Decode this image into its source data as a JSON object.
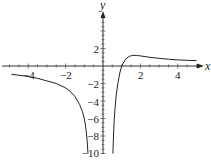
{
  "chart_data": {
    "type": "line",
    "title": "",
    "xlabel": "x",
    "ylabel": "y",
    "xlim": [
      -5.5,
      5.3
    ],
    "ylim": [
      -10,
      5.5
    ],
    "grid": false,
    "legend": null,
    "x_ticks": [
      -4,
      -2,
      2,
      4
    ],
    "y_ticks": [
      2,
      -2,
      -4,
      -6,
      -8,
      -10
    ],
    "x_tick_labels": [
      "−4",
      "−2",
      "2",
      "4"
    ],
    "y_tick_labels": [
      "2",
      "−2",
      "−4",
      "−6",
      "−8",
      "−10"
    ],
    "vertical_asymptote": 0,
    "horizontal_asymptote": 0,
    "series": [
      {
        "name": "left branch",
        "x": [
          -4.9,
          -4.5,
          -4,
          -3.5,
          -3,
          -2.5,
          -2,
          -1.75,
          -1.5,
          -1.25,
          -1.1,
          -1.0,
          -0.95,
          -0.9,
          -0.85,
          -0.8
        ],
        "y": [
          -0.95,
          -1.05,
          -1.2,
          -1.4,
          -1.7,
          -2.0,
          -2.5,
          -2.9,
          -3.5,
          -4.4,
          -5.2,
          -6.0,
          -6.6,
          -7.4,
          -8.5,
          -10.0
        ]
      },
      {
        "name": "right branch",
        "x": [
          0.53,
          0.56,
          0.6,
          0.65,
          0.7,
          0.8,
          0.9,
          1.0,
          1.2,
          1.4,
          1.6,
          1.8,
          2.0,
          2.5,
          3.0,
          3.5,
          4.0,
          4.5,
          5.0
        ],
        "y": [
          -10.0,
          -8.0,
          -6.2,
          -4.6,
          -3.4,
          -1.9,
          -0.8,
          0.0,
          0.75,
          1.1,
          1.22,
          1.2,
          1.15,
          1.0,
          0.88,
          0.78,
          0.7,
          0.65,
          0.62
        ]
      }
    ]
  },
  "labels": {
    "x_axis": "x",
    "y_axis": "y",
    "x_ticks": [
      "−4",
      "−2",
      "2",
      "4"
    ],
    "y_ticks": [
      "2",
      "−2",
      "−4",
      "−6",
      "−8",
      "−10"
    ]
  }
}
